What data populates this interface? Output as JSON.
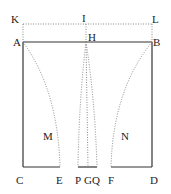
{
  "diagram": {
    "labels": {
      "K": "K",
      "I": "I",
      "L": "L",
      "A": "A",
      "H": "H",
      "B": "B",
      "M": "M",
      "N": "N",
      "C": "C",
      "E": "E",
      "P": "P",
      "G": "G",
      "Q": "Q",
      "F": "F",
      "D": "D"
    },
    "colors": {
      "line": "#333333",
      "dotted": "#888888"
    }
  }
}
